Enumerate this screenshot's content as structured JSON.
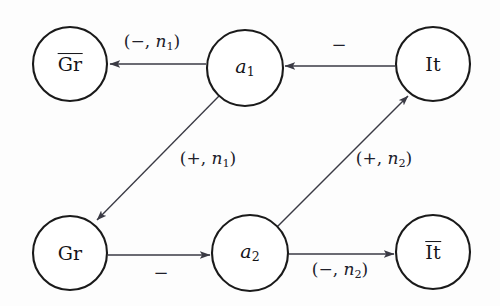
{
  "diagram": {
    "background_color": "#fdfdfd",
    "stroke_color": "#1a1a1a",
    "edge_color": "#3a3a44",
    "nodes": [
      {
        "id": "gr_bar",
        "label_base": "Gr",
        "overline": true,
        "italic": false,
        "sub": "",
        "cx": 70,
        "cy": 64,
        "r": 37
      },
      {
        "id": "a1",
        "label_base": "a",
        "overline": false,
        "italic": true,
        "sub": "1",
        "cx": 245,
        "cy": 68,
        "r": 38
      },
      {
        "id": "it",
        "label_base": "It",
        "overline": false,
        "italic": false,
        "sub": "",
        "cx": 433,
        "cy": 64,
        "r": 37
      },
      {
        "id": "gr",
        "label_base": "Gr",
        "overline": false,
        "italic": false,
        "sub": "",
        "cx": 70,
        "cy": 253,
        "r": 37
      },
      {
        "id": "a2",
        "label_base": "a",
        "overline": false,
        "italic": true,
        "sub": "2",
        "cx": 250,
        "cy": 253,
        "r": 38
      },
      {
        "id": "it_bar",
        "label_base": "It",
        "overline": true,
        "italic": false,
        "sub": "",
        "cx": 433,
        "cy": 252,
        "r": 37
      }
    ],
    "edges": [
      {
        "id": "a1-to-grbar",
        "from": "a1",
        "to": "gr_bar",
        "sign": "−",
        "modifier": "n",
        "modifier_sub": "1",
        "label": "(−, n₁)",
        "label_x": 152,
        "label_y": 43
      },
      {
        "id": "it-to-a1",
        "from": "it",
        "to": "a1",
        "sign": "−",
        "modifier": "",
        "modifier_sub": "",
        "label": "−",
        "label_x": 339,
        "label_y": 45
      },
      {
        "id": "a1-to-gr",
        "from": "a1",
        "to": "gr",
        "sign": "+",
        "modifier": "n",
        "modifier_sub": "1",
        "label": "(+, n₁)",
        "label_x": 208,
        "label_y": 160
      },
      {
        "id": "gr-to-a2",
        "from": "gr",
        "to": "a2",
        "sign": "−",
        "modifier": "",
        "modifier_sub": "",
        "label": "−",
        "label_x": 161,
        "label_y": 273
      },
      {
        "id": "a2-to-it",
        "from": "a2",
        "to": "it",
        "sign": "+",
        "modifier": "n",
        "modifier_sub": "2",
        "label": "(+, n₂)",
        "label_x": 384,
        "label_y": 160
      },
      {
        "id": "a2-to-itbar",
        "from": "a2",
        "to": "it_bar",
        "sign": "−",
        "modifier": "n",
        "modifier_sub": "2",
        "label": "(−, n₂)",
        "label_x": 340,
        "label_y": 271
      }
    ]
  }
}
